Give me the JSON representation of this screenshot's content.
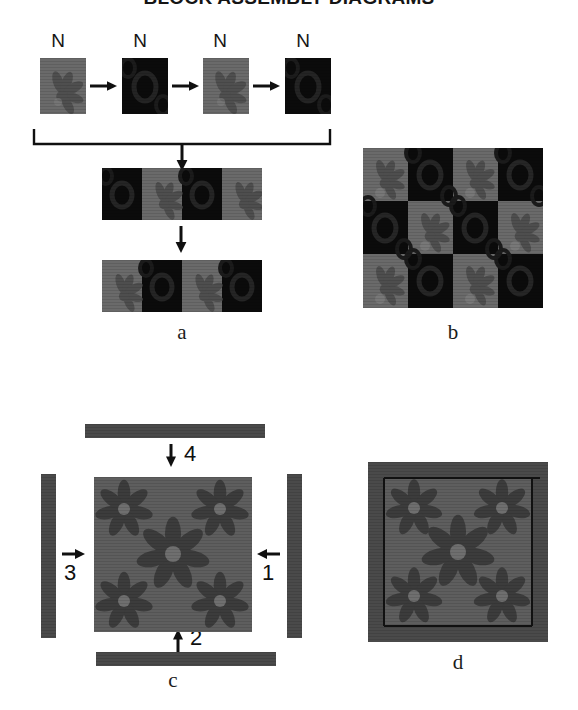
{
  "title": "BLOCK ASSEMBLY DIAGRAMS",
  "colors": {
    "fabric_light": "#6a6a6a",
    "fabric_dark": "#0b0b0b",
    "fabric_border": "#4a4a4a",
    "fabric_center": "#5e5e5e",
    "motif_light": "#565656",
    "motif_dark": "#1d1d1d",
    "motif_border": "#383838",
    "ink": "#101010",
    "page": "#ffffff"
  },
  "row_labels": {
    "n1": "N",
    "n2": "N",
    "n3": "N",
    "n4": "N"
  },
  "panels": {
    "a": {
      "caption": "a",
      "source_tiles": [
        {
          "fabric": "light",
          "motif": "flower"
        },
        {
          "fabric": "dark",
          "motif": "ring"
        },
        {
          "fabric": "light",
          "motif": "flower"
        },
        {
          "fabric": "dark",
          "motif": "ring"
        }
      ],
      "strip_1": [
        "dark",
        "light",
        "dark",
        "light"
      ],
      "strip_2": [
        "light",
        "dark",
        "light",
        "dark"
      ]
    },
    "b": {
      "caption": "b",
      "grid": [
        [
          "light",
          "dark",
          "light",
          "dark"
        ],
        [
          "dark",
          "light",
          "dark",
          "light"
        ],
        [
          "light",
          "dark",
          "light",
          "dark"
        ]
      ],
      "rows": 3,
      "cols": 4
    },
    "c": {
      "caption": "c",
      "center_motifs": 5,
      "borders": [
        {
          "number": "1",
          "position": "right",
          "arrow": "left"
        },
        {
          "number": "2",
          "position": "bottom",
          "arrow": "up"
        },
        {
          "number": "3",
          "position": "left",
          "arrow": "right"
        },
        {
          "number": "4",
          "position": "top",
          "arrow": "down"
        }
      ]
    },
    "d": {
      "caption": "d",
      "center_motifs": 5,
      "assembled": true
    }
  }
}
